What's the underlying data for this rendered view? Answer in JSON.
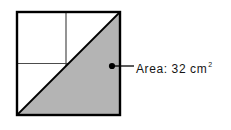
{
  "figure": {
    "area_label": "Area: 32 cm",
    "area_exponent": "2",
    "colors": {
      "shade": "#b4b4b4",
      "outline": "#000000",
      "inner_line": "#4c4c4c",
      "background": "#ffffff"
    }
  }
}
